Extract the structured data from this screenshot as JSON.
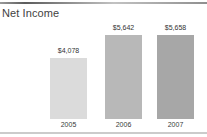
{
  "header": {
    "title": "Net Income"
  },
  "chart_data": {
    "type": "bar",
    "title": "Net Income",
    "categories": [
      "2005",
      "2006",
      "2007"
    ],
    "values": [
      4078,
      5642,
      5658
    ],
    "value_labels": [
      "$4,078",
      "$5,642",
      "$5,658"
    ],
    "bar_colors": [
      "#dbdbdb",
      "#b8b8b8",
      "#a7a7a7"
    ],
    "xlabel": "",
    "ylabel": "",
    "ylim": [
      0,
      5658
    ],
    "grid": false,
    "legend": false
  },
  "colors": {
    "top_rule": "#6b6b6b",
    "bottom_rule": "#cbcbcb",
    "text": "#3a3a3a",
    "background": "#ffffff"
  }
}
